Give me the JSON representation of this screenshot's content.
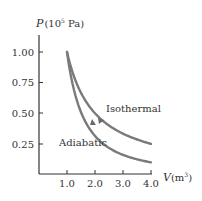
{
  "chart_data": {
    "type": "line",
    "title": "",
    "xlabel": "V",
    "xlabel_unit": "(m",
    "xlabel_unit_sup": "3",
    "xlabel_unit_close": ")",
    "ylabel": "P",
    "ylabel_unit_open": "(10",
    "ylabel_unit_sup": "5",
    "ylabel_unit_close": " Pa)",
    "x_ticks": [
      "1.0",
      "2.0",
      "3.0",
      "4.0"
    ],
    "y_ticks": [
      "1.00",
      "0.75",
      "0.50",
      "0.25"
    ],
    "xlim": [
      0,
      4.0
    ],
    "ylim": [
      0,
      1.1
    ],
    "grid": false,
    "series": [
      {
        "name": "Isothermal",
        "x": [
          1.0,
          1.5,
          2.0,
          2.5,
          3.0,
          3.5,
          4.0
        ],
        "values": [
          1.0,
          0.667,
          0.5,
          0.4,
          0.333,
          0.286,
          0.25
        ]
      },
      {
        "name": "Adiabatic",
        "x": [
          1.0,
          1.5,
          2.0,
          2.5,
          3.0,
          3.5,
          4.0
        ],
        "values": [
          1.0,
          0.509,
          0.315,
          0.217,
          0.16,
          0.124,
          0.099
        ]
      }
    ],
    "annotations": [
      "Isothermal",
      "Adiabatic"
    ],
    "curve_color": "#7a7a7a",
    "axis_color": "#333333"
  }
}
